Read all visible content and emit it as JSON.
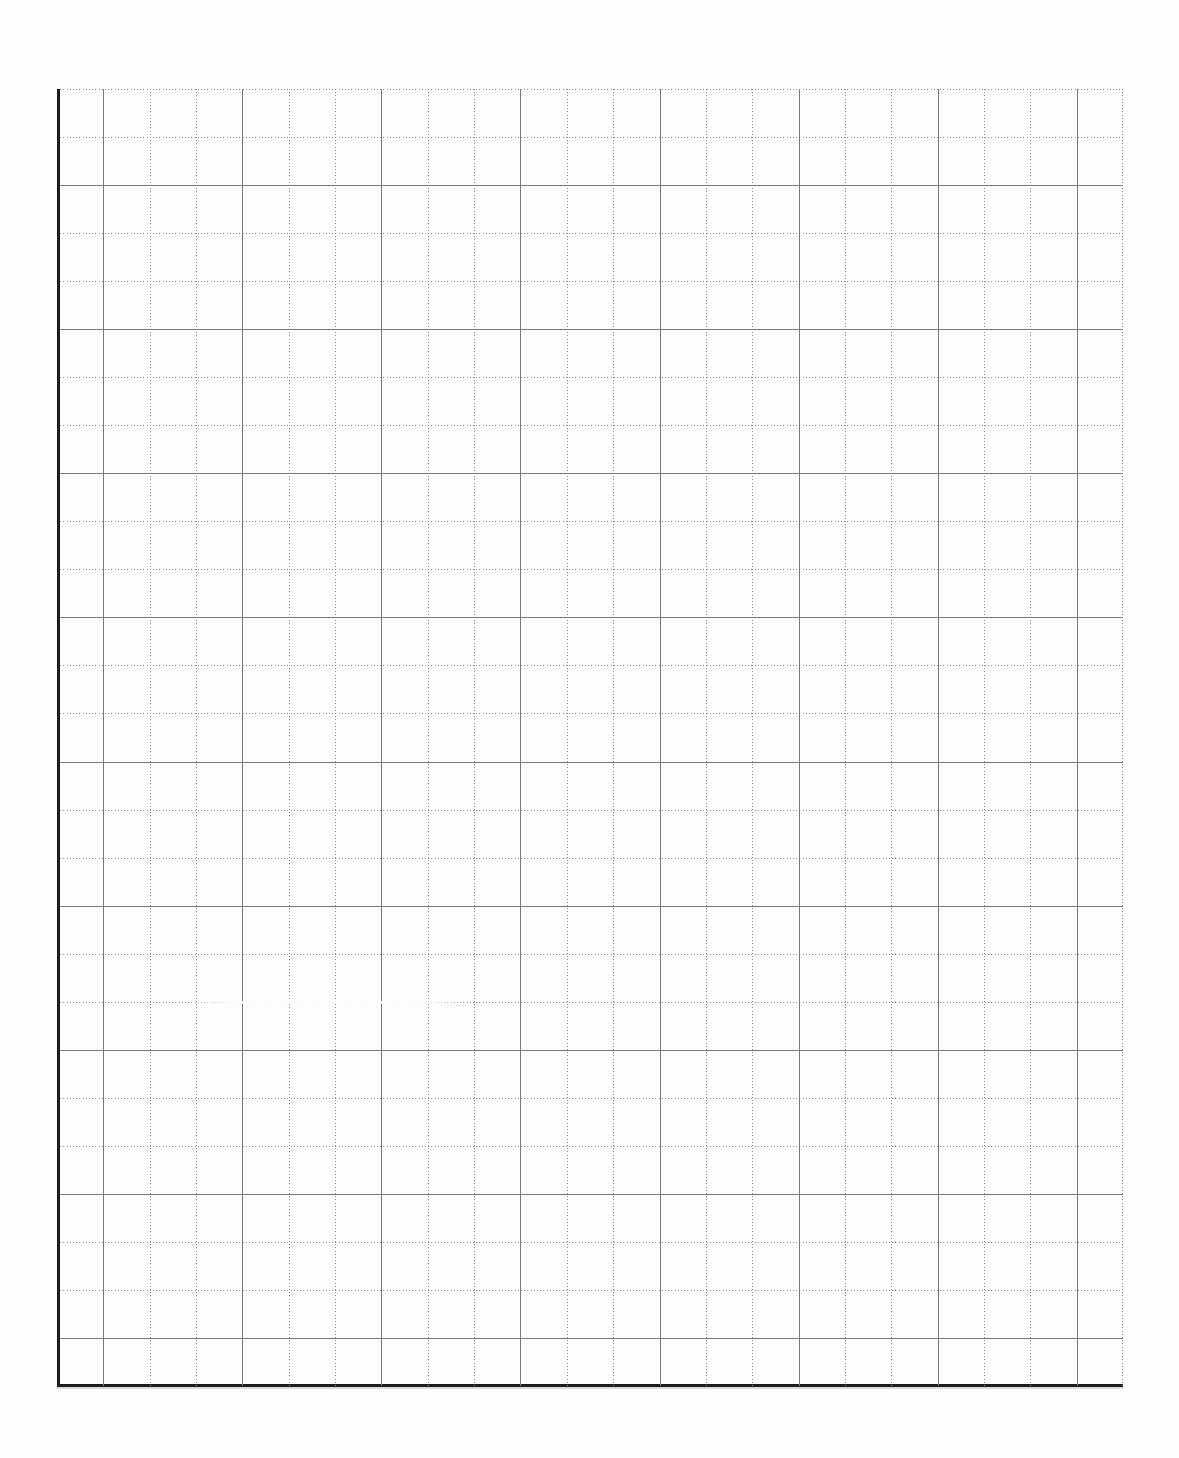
{
  "page": {
    "type": "scanned-blank-graph-paper-sheet",
    "background_color": "#fdfdfd",
    "width_px": 1179,
    "height_px": 1458,
    "visible_text": ""
  },
  "grid": {
    "left": 57,
    "top": 89,
    "width": 1066,
    "height": 1297,
    "columns": 23,
    "rows": 27,
    "major_every": 3,
    "major_col_offset": 1,
    "major_row_offset": 2,
    "line_colors": {
      "minor": "#8f8f8f",
      "major": "#7b7b7b",
      "border": "#1c1c1c"
    },
    "line_styles": {
      "left_edge": "solid-thick-dark",
      "bottom_edge": "solid-thick-dark",
      "top_edge": "dotted",
      "right_edge": "dotted",
      "minor_lines": "dotted",
      "major_lines": "solid"
    },
    "artifacts": [
      {
        "type": "faded-line-segment",
        "row_line_index": 19,
        "x_start": 130,
        "x_end": 410
      }
    ]
  }
}
